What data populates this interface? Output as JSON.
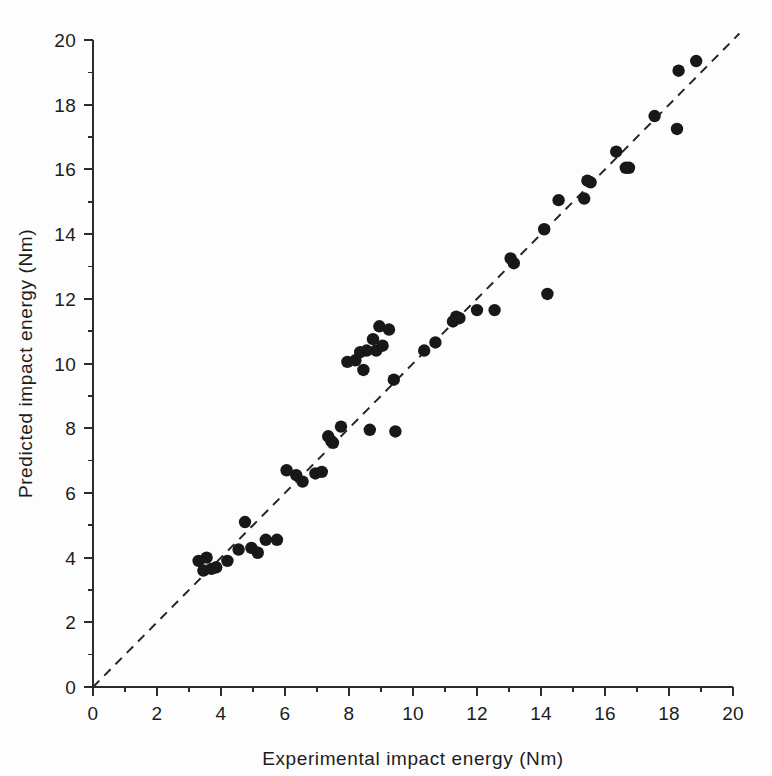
{
  "figure": {
    "background_color": "#fdfdfd",
    "point_color": "#181818",
    "axis_color": "#2b2b2b",
    "reference_line_color": "#262626"
  },
  "axes": {
    "x_title": "Experimental impact energy (Nm)",
    "y_title": "Predicted impact energy (Nm)",
    "x_ticks": [
      "0",
      "2",
      "4",
      "6",
      "8",
      "10",
      "12",
      "14",
      "16",
      "18",
      "20"
    ],
    "y_ticks": [
      "0",
      "2",
      "4",
      "6",
      "8",
      "10",
      "12",
      "14",
      "16",
      "18",
      "20"
    ]
  },
  "chart_data": {
    "type": "scatter",
    "title": "",
    "xlabel": "Experimental impact energy (Nm)",
    "ylabel": "Predicted impact energy (Nm)",
    "xlim": [
      0,
      20
    ],
    "ylim": [
      0,
      20
    ],
    "xticks": [
      0,
      2,
      4,
      6,
      8,
      10,
      12,
      14,
      16,
      18,
      20
    ],
    "yticks": [
      0,
      2,
      4,
      6,
      8,
      10,
      12,
      14,
      16,
      18,
      20
    ],
    "grid": false,
    "legend": "none",
    "minor_ticks": true,
    "minor_tick_step": 1,
    "annotations": [
      {
        "type": "reference_line",
        "label": "1:1 parity line",
        "style": "dashed",
        "x": [
          0,
          20.2
        ],
        "y": [
          0,
          20.2
        ]
      }
    ],
    "series": [
      {
        "name": "Specimens",
        "marker": "filled-circle",
        "color": "#181818",
        "points": [
          [
            3.3,
            3.9
          ],
          [
            3.45,
            3.6
          ],
          [
            3.55,
            4.0
          ],
          [
            3.7,
            3.65
          ],
          [
            3.85,
            3.7
          ],
          [
            4.2,
            3.9
          ],
          [
            4.55,
            4.25
          ],
          [
            4.75,
            5.1
          ],
          [
            4.95,
            4.3
          ],
          [
            5.15,
            4.15
          ],
          [
            5.4,
            4.55
          ],
          [
            5.75,
            4.55
          ],
          [
            6.05,
            6.7
          ],
          [
            6.35,
            6.55
          ],
          [
            6.55,
            6.35
          ],
          [
            6.95,
            6.6
          ],
          [
            7.15,
            6.65
          ],
          [
            7.35,
            7.75
          ],
          [
            7.45,
            7.6
          ],
          [
            7.5,
            7.55
          ],
          [
            7.75,
            8.05
          ],
          [
            7.95,
            10.05
          ],
          [
            8.2,
            10.1
          ],
          [
            8.35,
            10.35
          ],
          [
            8.45,
            9.8
          ],
          [
            8.55,
            10.4
          ],
          [
            8.65,
            7.95
          ],
          [
            8.75,
            10.75
          ],
          [
            8.85,
            10.4
          ],
          [
            8.95,
            11.15
          ],
          [
            9.05,
            10.55
          ],
          [
            9.25,
            11.05
          ],
          [
            9.4,
            9.5
          ],
          [
            9.45,
            7.9
          ],
          [
            10.35,
            10.4
          ],
          [
            10.7,
            10.65
          ],
          [
            11.25,
            11.3
          ],
          [
            11.35,
            11.45
          ],
          [
            11.45,
            11.4
          ],
          [
            12.0,
            11.65
          ],
          [
            12.55,
            11.65
          ],
          [
            13.05,
            13.25
          ],
          [
            13.15,
            13.1
          ],
          [
            14.1,
            14.15
          ],
          [
            14.2,
            12.15
          ],
          [
            14.55,
            15.05
          ],
          [
            15.35,
            15.1
          ],
          [
            15.45,
            15.65
          ],
          [
            15.55,
            15.6
          ],
          [
            16.35,
            16.55
          ],
          [
            16.65,
            16.05
          ],
          [
            16.75,
            16.05
          ],
          [
            17.55,
            17.65
          ],
          [
            18.25,
            17.25
          ],
          [
            18.3,
            19.05
          ],
          [
            18.85,
            19.35
          ]
        ]
      }
    ]
  }
}
